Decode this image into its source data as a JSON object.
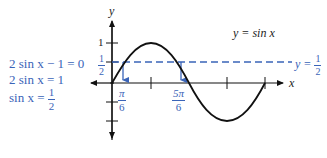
{
  "diagram": {
    "type": "function-graph",
    "function_label": "y = sin x",
    "line_label": {
      "prefix": "y =",
      "num": "1",
      "den": "2"
    },
    "axes": {
      "x_label": "x",
      "y_label": "y"
    },
    "y_ticks": [
      {
        "label": "1",
        "value": 1
      },
      {
        "label_num": "1",
        "label_den": "2",
        "value": 0.5
      }
    ],
    "x_markers": [
      {
        "num": "π",
        "den": "6",
        "value": 0.5236
      },
      {
        "num": "5π",
        "den": "6",
        "value": 2.618
      }
    ],
    "solution_steps": [
      {
        "text": "2 sin x − 1 = 0"
      },
      {
        "text": "2 sin x = 1"
      },
      {
        "prefix": "sin x =",
        "num": "1",
        "den": "2"
      }
    ],
    "colors": {
      "curve": "#111111",
      "axes": "#111111",
      "annotation": "#3a64b8"
    }
  }
}
